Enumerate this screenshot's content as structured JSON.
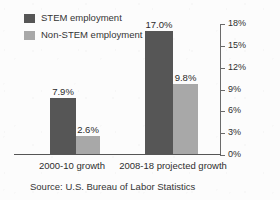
{
  "chart_data": {
    "type": "bar",
    "title": "",
    "xlabel": "",
    "ylabel": "",
    "categories": [
      "2000-10 growth",
      "2008-18 projected growth"
    ],
    "series": [
      {
        "name": "STEM employment",
        "color": "#565656",
        "values": [
          7.9,
          9.8
        ],
        "value_labels": [
          "7.9%",
          "17.0%"
        ]
      },
      {
        "name": "Non-STEM employment",
        "color": "#a8a8a8",
        "values": [
          2.6,
          9.8
        ],
        "value_labels": [
          "2.6%",
          "9.8%"
        ]
      }
    ],
    "grouped_values": [
      {
        "category": "2000-10 growth",
        "stem": 7.9,
        "non_stem": 2.6
      },
      {
        "category": "2008-18 projected growth",
        "stem": 17.0,
        "non_stem": 9.8
      }
    ],
    "ylim": [
      0,
      18
    ],
    "ytick_step": 3,
    "ytick_labels": [
      "0%",
      "3%",
      "6%",
      "9%",
      "12%",
      "15%",
      "18%"
    ],
    "ytick_values": [
      0,
      3,
      6,
      9,
      12,
      15,
      18
    ],
    "yaxis_position": "right",
    "grid": false,
    "legend_position": "top-left",
    "annotations": [
      "Source: U.S. Bureau of Labor Statistics"
    ]
  },
  "legend": {
    "items": [
      {
        "label": "STEM employment",
        "color": "#565656"
      },
      {
        "label": "Non-STEM employment",
        "color": "#a8a8a8"
      }
    ]
  },
  "bars": {
    "g0s0": "7.9%",
    "g0s1": "2.6%",
    "g1s0": "17.0%",
    "g1s1": "9.8%"
  },
  "axis": {
    "ticks": [
      "18%",
      "15%",
      "12%",
      "9%",
      "6%",
      "3%",
      "0%"
    ]
  },
  "categories": {
    "first": "2000-10 growth",
    "second": "2008-18 projected growth"
  },
  "source": {
    "text": "Source: U.S. Bureau of Labor Statistics"
  }
}
